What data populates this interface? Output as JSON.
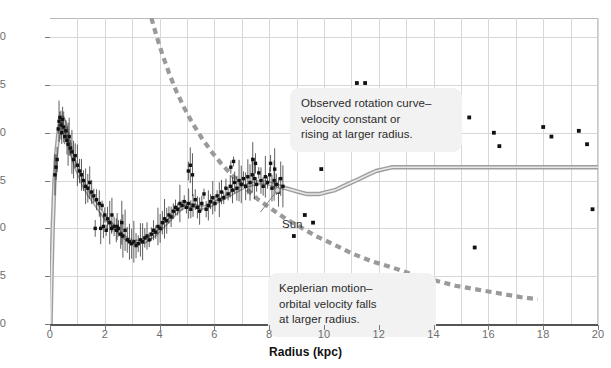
{
  "chart_data": {
    "type": "scatter",
    "title": "",
    "xlabel": "Radius (kpc)",
    "ylabel": "Orbital velocity (km/s)",
    "xlim": [
      0,
      20
    ],
    "ylim": [
      150,
      310
    ],
    "xticks": [
      0,
      2,
      4,
      6,
      8,
      10,
      12,
      14,
      16,
      18,
      20
    ],
    "yticks": [
      150,
      175,
      200,
      225,
      250,
      275,
      300
    ],
    "grid": true,
    "legend_position": "none",
    "annotations": [
      {
        "name": "observed-rotation-curve",
        "text": "Observed rotation curve–velocity constant or rising at larger radius.",
        "line1": "Observed rotation curve–",
        "line2": "velocity constant or",
        "line3": "rising at larger radius."
      },
      {
        "name": "keplerian-motion",
        "text": "Keplerian motion–orbital velocity falls at larger radius.",
        "line1": "Keplerian motion–",
        "line2": "orbital velocity falls",
        "line3": "at larger radius."
      },
      {
        "name": "sun-marker",
        "text": "Sun",
        "x": 8.3,
        "y": 220
      }
    ],
    "series": [
      {
        "name": "Observed rotation curve (model fit)",
        "type": "line",
        "style": "solid",
        "color": "#808080",
        "points": [
          [
            0.02,
            150
          ],
          [
            0.06,
            178
          ],
          [
            0.1,
            201
          ],
          [
            0.16,
            224
          ],
          [
            0.22,
            238
          ],
          [
            0.3,
            249
          ],
          [
            0.38,
            256
          ],
          [
            0.45,
            258
          ],
          [
            0.52,
            256
          ],
          [
            0.6,
            251
          ],
          [
            0.7,
            245
          ],
          [
            0.82,
            238
          ],
          [
            0.95,
            232
          ],
          [
            1.1,
            227
          ],
          [
            1.25,
            222
          ],
          [
            1.45,
            217
          ],
          [
            1.65,
            213
          ],
          [
            1.85,
            209
          ],
          [
            2.05,
            205
          ],
          [
            2.25,
            202
          ],
          [
            2.45,
            199
          ],
          [
            2.65,
            196
          ],
          [
            2.85,
            194
          ],
          [
            3.05,
            193
          ],
          [
            3.25,
            193
          ],
          [
            3.45,
            193
          ],
          [
            3.65,
            195
          ],
          [
            3.85,
            197
          ],
          [
            4.05,
            200
          ],
          [
            4.25,
            203
          ],
          [
            4.45,
            206
          ],
          [
            4.65,
            209
          ],
          [
            4.85,
            211
          ],
          [
            5.05,
            212
          ],
          [
            5.25,
            212
          ],
          [
            5.45,
            211
          ],
          [
            5.65,
            211
          ],
          [
            5.85,
            212
          ],
          [
            6.1,
            214
          ],
          [
            6.35,
            216
          ],
          [
            6.6,
            218
          ],
          [
            6.85,
            220
          ],
          [
            7.1,
            222
          ],
          [
            7.35,
            223
          ],
          [
            7.6,
            224
          ],
          [
            7.85,
            224
          ],
          [
            8.1,
            223
          ],
          [
            8.35,
            222
          ],
          [
            8.6,
            221
          ],
          [
            8.85,
            220
          ],
          [
            9.1,
            219
          ],
          [
            9.35,
            218
          ],
          [
            9.6,
            218
          ],
          [
            9.85,
            218
          ],
          [
            10.1,
            219
          ],
          [
            10.4,
            220
          ],
          [
            10.7,
            222
          ],
          [
            11.0,
            224
          ],
          [
            11.3,
            226
          ],
          [
            11.6,
            228
          ],
          [
            11.9,
            230
          ],
          [
            12.2,
            231
          ],
          [
            12.5,
            232
          ],
          [
            12.9,
            232
          ],
          [
            13.4,
            232
          ],
          [
            14.0,
            232
          ],
          [
            15.0,
            232
          ],
          [
            16.0,
            232
          ],
          [
            17.0,
            232
          ],
          [
            18.0,
            232
          ],
          [
            19.0,
            232
          ],
          [
            20.0,
            232
          ]
        ]
      },
      {
        "name": "Keplerian motion (predicted)",
        "type": "line",
        "style": "dashed",
        "color": "#9a9a9a",
        "points": [
          [
            3.7,
            310
          ],
          [
            3.9,
            300
          ],
          [
            4.1,
            291
          ],
          [
            4.35,
            281
          ],
          [
            4.6,
            272
          ],
          [
            4.9,
            263
          ],
          [
            5.2,
            255
          ],
          [
            5.55,
            247
          ],
          [
            5.9,
            240
          ],
          [
            6.3,
            233
          ],
          [
            6.7,
            227
          ],
          [
            7.15,
            221
          ],
          [
            7.6,
            215
          ],
          [
            8.1,
            210
          ],
          [
            8.6,
            205
          ],
          [
            9.1,
            201
          ],
          [
            9.7,
            196
          ],
          [
            10.3,
            192
          ],
          [
            11.0,
            187
          ],
          [
            11.7,
            183
          ],
          [
            12.4,
            180
          ],
          [
            13.2,
            176
          ],
          [
            14.0,
            173
          ],
          [
            14.8,
            170
          ],
          [
            15.6,
            168
          ],
          [
            16.4,
            166
          ],
          [
            17.2,
            164
          ],
          [
            17.8,
            163
          ]
        ]
      },
      {
        "name": "Measured velocities (inner disk, with error bars)",
        "type": "scatter",
        "color": "#111111",
        "points": [
          [
            0.3,
            252
          ],
          [
            0.33,
            256
          ],
          [
            0.36,
            258
          ],
          [
            0.4,
            254
          ],
          [
            0.43,
            250
          ],
          [
            0.46,
            257
          ],
          [
            0.5,
            253
          ],
          [
            0.54,
            248
          ],
          [
            0.58,
            251
          ],
          [
            0.62,
            246
          ],
          [
            0.66,
            244
          ],
          [
            0.7,
            248
          ],
          [
            0.74,
            242
          ],
          [
            0.8,
            240
          ],
          [
            0.86,
            236
          ],
          [
            0.92,
            238
          ],
          [
            1.0,
            233
          ],
          [
            1.08,
            230
          ],
          [
            1.15,
            228
          ],
          [
            1.22,
            225
          ],
          [
            1.3,
            222
          ],
          [
            1.38,
            221
          ],
          [
            1.45,
            224
          ],
          [
            1.52,
            219
          ],
          [
            1.6,
            217
          ],
          [
            1.7,
            215
          ],
          [
            1.8,
            213
          ],
          [
            1.9,
            212
          ],
          [
            2.0,
            207
          ],
          [
            2.1,
            205
          ],
          [
            2.18,
            203
          ],
          [
            2.26,
            207
          ],
          [
            2.34,
            201
          ],
          [
            2.42,
            199
          ],
          [
            2.5,
            200
          ],
          [
            2.58,
            197
          ],
          [
            2.66,
            196
          ],
          [
            2.74,
            199
          ],
          [
            2.82,
            194
          ],
          [
            2.9,
            193
          ],
          [
            2.98,
            192
          ],
          [
            3.06,
            193
          ],
          [
            3.14,
            191
          ],
          [
            3.22,
            192
          ],
          [
            3.3,
            194
          ],
          [
            3.38,
            193
          ],
          [
            3.46,
            195
          ],
          [
            3.54,
            196
          ],
          [
            3.62,
            194
          ],
          [
            3.7,
            197
          ],
          [
            3.78,
            199
          ],
          [
            3.86,
            198
          ],
          [
            3.94,
            201
          ],
          [
            4.02,
            200
          ],
          [
            4.1,
            203
          ],
          [
            4.18,
            205
          ],
          [
            4.26,
            204
          ],
          [
            4.34,
            207
          ],
          [
            4.42,
            206
          ],
          [
            4.5,
            209
          ],
          [
            4.58,
            211
          ],
          [
            4.66,
            210
          ],
          [
            4.74,
            213
          ],
          [
            4.82,
            212
          ],
          [
            4.9,
            214
          ],
          [
            4.98,
            211
          ],
          [
            5.06,
            213
          ],
          [
            5.14,
            210
          ],
          [
            5.22,
            212
          ],
          [
            5.3,
            215
          ],
          [
            5.38,
            211
          ],
          [
            5.46,
            209
          ],
          [
            5.54,
            213
          ],
          [
            5.62,
            218
          ],
          [
            5.7,
            210
          ],
          [
            5.78,
            212
          ],
          [
            5.86,
            214
          ],
          [
            5.94,
            216
          ],
          [
            6.02,
            213
          ],
          [
            6.1,
            217
          ],
          [
            6.18,
            215
          ],
          [
            6.26,
            219
          ],
          [
            6.34,
            216
          ],
          [
            6.42,
            221
          ],
          [
            6.5,
            218
          ],
          [
            6.58,
            222
          ],
          [
            6.66,
            220
          ],
          [
            6.74,
            224
          ],
          [
            6.82,
            221
          ],
          [
            6.9,
            225
          ],
          [
            6.98,
            223
          ],
          [
            7.06,
            226
          ],
          [
            7.14,
            222
          ],
          [
            7.22,
            227
          ],
          [
            7.3,
            224
          ],
          [
            7.38,
            228
          ],
          [
            7.46,
            226
          ],
          [
            7.54,
            223
          ],
          [
            7.62,
            229
          ],
          [
            7.7,
            225
          ],
          [
            7.78,
            222
          ],
          [
            7.86,
            227
          ],
          [
            7.94,
            224
          ],
          [
            8.02,
            228
          ],
          [
            8.1,
            221
          ],
          [
            8.18,
            225
          ],
          [
            8.26,
            223
          ],
          [
            8.34,
            219
          ],
          [
            8.42,
            226
          ],
          [
            8.5,
            222
          ],
          [
            1.65,
            200
          ],
          [
            1.85,
            200
          ],
          [
            2.05,
            199
          ],
          [
            2.25,
            200
          ],
          [
            2.45,
            201
          ],
          [
            0.26,
            236
          ],
          [
            0.22,
            232
          ],
          [
            0.18,
            228
          ],
          [
            1.95,
            201
          ],
          [
            2.62,
            203
          ],
          [
            5.05,
            230
          ],
          [
            5.12,
            233
          ],
          [
            5.2,
            228
          ],
          [
            6.6,
            232
          ],
          [
            6.7,
            235
          ],
          [
            7.4,
            236
          ],
          [
            7.5,
            234
          ],
          [
            8.05,
            234
          ],
          [
            8.2,
            231
          ]
        ]
      },
      {
        "name": "Measured velocities (outer disk)",
        "type": "scatter",
        "color": "#111111",
        "points": [
          [
            8.9,
            196
          ],
          [
            9.3,
            207
          ],
          [
            9.6,
            203
          ],
          [
            10.4,
            260
          ],
          [
            10.6,
            251
          ],
          [
            11.2,
            276
          ],
          [
            11.5,
            276
          ],
          [
            12.1,
            262
          ],
          [
            12.4,
            256
          ],
          [
            12.9,
            249
          ],
          [
            13.5,
            245
          ],
          [
            14.3,
            269
          ],
          [
            14.6,
            268
          ],
          [
            15.3,
            258
          ],
          [
            15.5,
            190
          ],
          [
            16.2,
            250
          ],
          [
            16.4,
            243
          ],
          [
            18.0,
            253
          ],
          [
            18.3,
            248
          ],
          [
            19.3,
            251
          ],
          [
            19.6,
            244
          ],
          [
            19.8,
            210
          ],
          [
            13.0,
            253
          ],
          [
            9.9,
            231
          ]
        ]
      }
    ]
  }
}
